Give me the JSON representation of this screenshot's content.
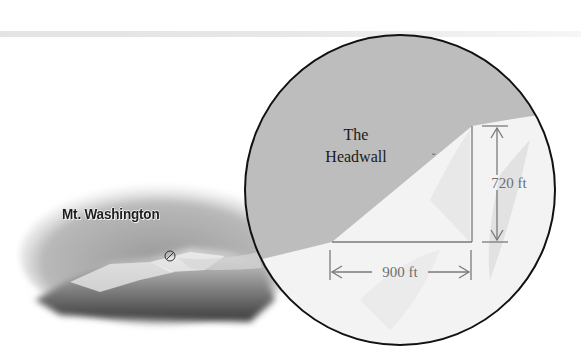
{
  "photo": {
    "label": "Mt. Washington",
    "marker_icon": "circle-slash-marker"
  },
  "inset": {
    "headwall_label_line1": "The",
    "headwall_label_line2": "Headwall",
    "vertical_dimension": "720 ft",
    "horizontal_dimension": "900 ft"
  },
  "colors": {
    "sky_gray": "#bdbdbd",
    "snow": "#f2f2f2",
    "outline": "#111111",
    "dimension_line": "#7a7a7a"
  }
}
